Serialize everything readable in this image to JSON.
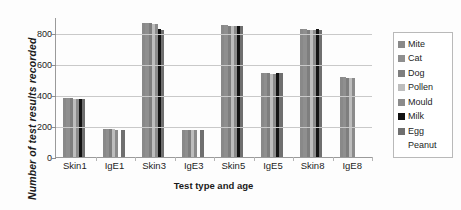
{
  "chart_data": {
    "type": "bar",
    "title": "",
    "xlabel": "Test type and age",
    "ylabel": "Number of test results recorded",
    "categories": [
      "Skin1",
      "IgE1",
      "Skin3",
      "IgE3",
      "Skin5",
      "IgE5",
      "Skin8",
      "IgE8"
    ],
    "ylim": [
      0,
      900
    ],
    "yticks": [
      0,
      200,
      400,
      600,
      800
    ],
    "ytick_labels": [
      "0",
      "200",
      "400",
      "600",
      "800"
    ],
    "grid": true,
    "legend_position": "right",
    "series": [
      {
        "name": "Mite",
        "color": "#898989",
        "values": [
          380,
          182,
          862,
          176,
          846,
          540,
          820,
          512
        ]
      },
      {
        "name": "Cat",
        "color": "#8f8f8f",
        "values": [
          380,
          182,
          862,
          176,
          846,
          540,
          820,
          512
        ]
      },
      {
        "name": "Dog",
        "color": "#7e7e7e",
        "values": [
          378,
          180,
          860,
          175,
          845,
          538,
          818,
          510
        ]
      },
      {
        "name": "Pollen",
        "color": "#bdbdbd",
        "values": [
          376,
          178,
          858,
          174,
          843,
          536,
          816,
          508
        ]
      },
      {
        "name": "Mould",
        "color": "#8b8b8b",
        "values": [
          374,
          176,
          856,
          172,
          842,
          534,
          815,
          506
        ]
      },
      {
        "name": "Milk",
        "color": "#121212",
        "values": [
          376,
          0,
          820,
          0,
          843,
          543,
          820,
          0
        ]
      },
      {
        "name": "Egg",
        "color": "#6f6f6f",
        "values": [
          374,
          176,
          818,
          175,
          841,
          541,
          818,
          0
        ]
      },
      {
        "name": "Peanut",
        "color": "#ffffff",
        "values": [
          0,
          0,
          0,
          0,
          0,
          0,
          0,
          0
        ]
      }
    ]
  },
  "legend": {
    "items": [
      {
        "label": "Mite",
        "color": "#898989"
      },
      {
        "label": "Cat",
        "color": "#8f8f8f"
      },
      {
        "label": "Dog",
        "color": "#7e7e7e"
      },
      {
        "label": "Pollen",
        "color": "#bdbdbd"
      },
      {
        "label": "Mould",
        "color": "#8b8b8b"
      },
      {
        "label": "Milk",
        "color": "#121212"
      },
      {
        "label": "Egg",
        "color": "#6f6f6f"
      },
      {
        "label": "Peanut",
        "color": "transparent"
      }
    ]
  }
}
